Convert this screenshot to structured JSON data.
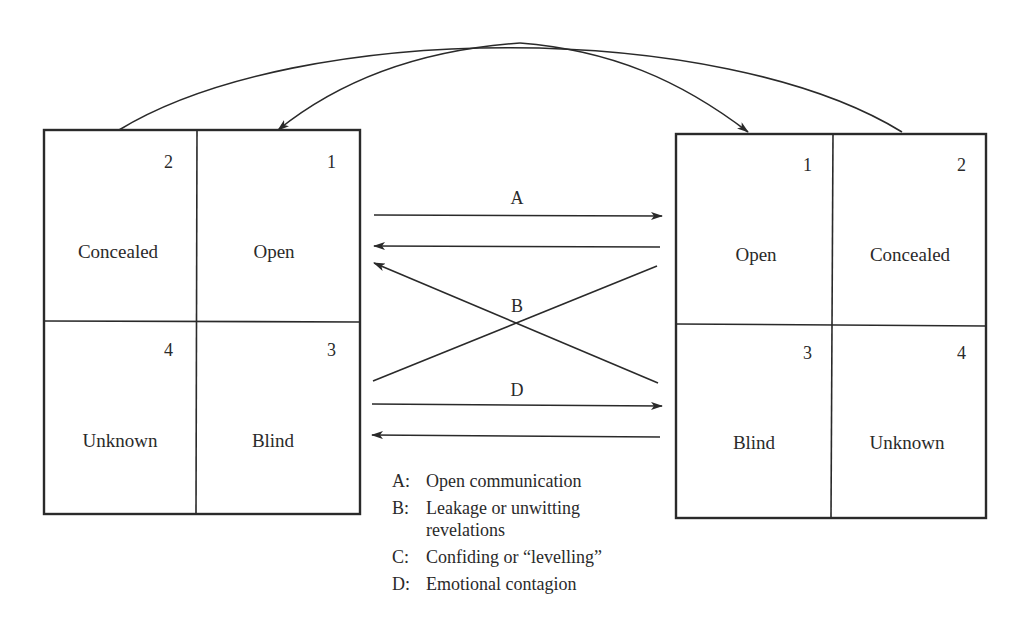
{
  "left_window": {
    "cells": [
      {
        "number": "2",
        "label": "Concealed"
      },
      {
        "number": "1",
        "label": "Open"
      },
      {
        "number": "4",
        "label": "Unknown"
      },
      {
        "number": "3",
        "label": "Blind"
      }
    ]
  },
  "right_window": {
    "cells": [
      {
        "number": "1",
        "label": "Open"
      },
      {
        "number": "2",
        "label": "Concealed"
      },
      {
        "number": "3",
        "label": "Blind"
      },
      {
        "number": "4",
        "label": "Unknown"
      }
    ]
  },
  "arrows": {
    "a_label": "A",
    "b_label": "B",
    "d_label": "D"
  },
  "legend": [
    {
      "key": "A:",
      "text": "Open communication"
    },
    {
      "key": "B:",
      "text": "Leakage or unwitting revelations"
    },
    {
      "key": "C:",
      "text": "Confiding or “levelling”"
    },
    {
      "key": "D:",
      "text": "Emotional contagion"
    }
  ],
  "colors": {
    "ink": "#2a2a2a",
    "background": "#ffffff"
  }
}
